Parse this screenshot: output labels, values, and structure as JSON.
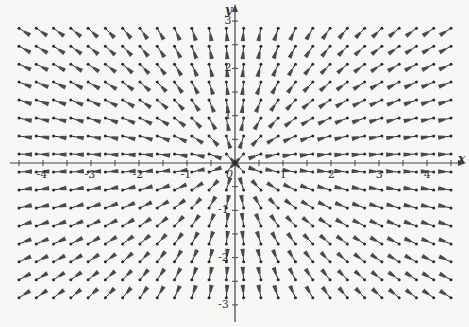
{
  "chart_data": {
    "type": "vector_field",
    "title": "",
    "xlabel": "x",
    "ylabel": "y",
    "xlim": [
      -4.8,
      4.8
    ],
    "ylim": [
      -3.3,
      3.3
    ],
    "x_ticks": [
      -4,
      -3,
      -2,
      -1,
      0,
      1,
      2,
      3,
      4
    ],
    "x_tick_labels": [
      "-4",
      "-3",
      "-2",
      "-1",
      "0",
      "1",
      "2",
      "3",
      "4"
    ],
    "y_ticks": [
      -3,
      -2,
      -1,
      1,
      2,
      3
    ],
    "y_tick_labels": [
      "-3",
      "-2",
      "-1",
      "1",
      "2",
      "3"
    ],
    "minor_tick_step": 0.5,
    "grid": false,
    "field_description": "Unit vectors pointing radially toward the origin: F(x,y) = -(x, y)/sqrt(x^2 + y^2)",
    "field": {
      "fx": "-x/r",
      "fy": "-y/r"
    },
    "sample_columns": 26,
    "sample_rows": 16,
    "sample_x_range": [
      -4.5,
      4.5
    ],
    "sample_y_range": [
      2.85,
      -2.85
    ],
    "arrow_color": "#2b2b2b"
  },
  "axes": {
    "x_name": "x",
    "y_name": "y",
    "origin_label": "0"
  }
}
